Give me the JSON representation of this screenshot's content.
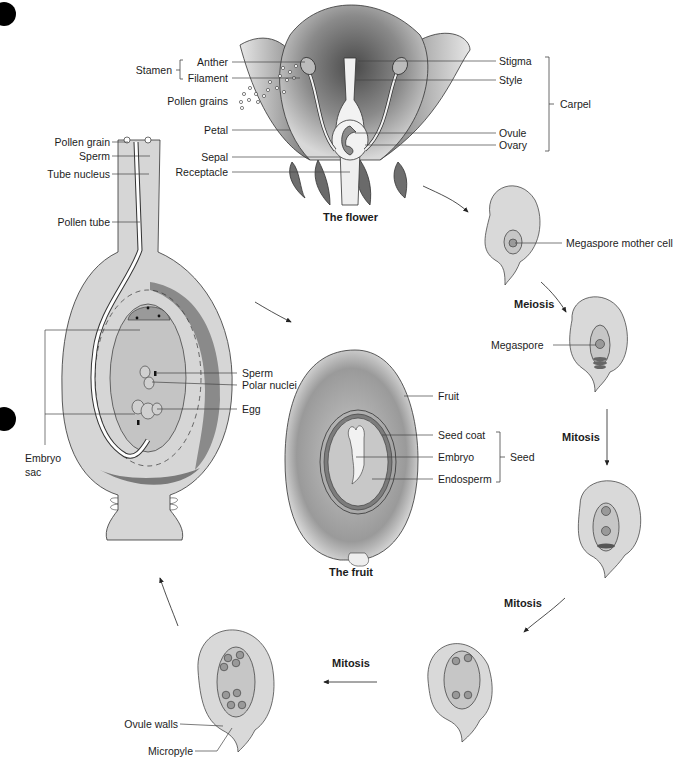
{
  "diagram": {
    "colors": {
      "light_fill": "#d6d6d6",
      "mid_fill": "#a8a8a8",
      "dark_fill": "#6e6e6e",
      "line": "#333333",
      "text": "#1c1c1c"
    }
  },
  "flower": {
    "caption": "The flower",
    "labels_left": {
      "stamen_group": "Stamen",
      "anther": "Anther",
      "filament": "Filament",
      "pollen_grains": "Pollen grains",
      "petal": "Petal",
      "sepal": "Sepal",
      "receptacle": "Receptacle"
    },
    "labels_right": {
      "stigma": "Stigma",
      "style": "Style",
      "ovule": "Ovule",
      "ovary": "Ovary",
      "carpel_group": "Carpel"
    }
  },
  "ovule_stages": {
    "stage1_label": "Megaspore mother cell",
    "meiosis_label": "Meiosis",
    "stage2_label": "Megaspore",
    "mitosis1_label": "Mitosis",
    "mitosis2_label": "Mitosis",
    "mitosis3_label": "Mitosis",
    "ovule_walls": "Ovule walls",
    "micropyle": "Micropyle"
  },
  "fertilization": {
    "pollen_grain": "Pollen grain",
    "sperm_top": "Sperm",
    "tube_nucleus": "Tube nucleus",
    "pollen_tube": "Pollen tube",
    "embryo_sac": "Embryo\nsac",
    "embryo_sac_line1": "Embryo",
    "embryo_sac_line2": "sac",
    "sperm": "Sperm",
    "polar_nuclei": "Polar nuclei",
    "egg": "Egg"
  },
  "fruit": {
    "caption": "The fruit",
    "fruit": "Fruit",
    "seed_coat": "Seed coat",
    "embryo": "Embryo",
    "endosperm": "Endosperm",
    "seed_group": "Seed"
  }
}
